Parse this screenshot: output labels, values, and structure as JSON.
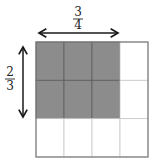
{
  "diagram": {
    "horizontal_label": {
      "numerator": "3",
      "denominator": "4"
    },
    "vertical_label": {
      "numerator": "2",
      "denominator": "3"
    },
    "grid": {
      "columns": 4,
      "rows": 3,
      "shaded_columns": 3,
      "shaded_rows": 2
    },
    "colors": {
      "shade": "#8c8c8c",
      "shade_line": "#5e5e5e",
      "grid_line": "#c8c8c8",
      "border": "#7a7a7a",
      "arrow": "#1a1a1a"
    }
  }
}
